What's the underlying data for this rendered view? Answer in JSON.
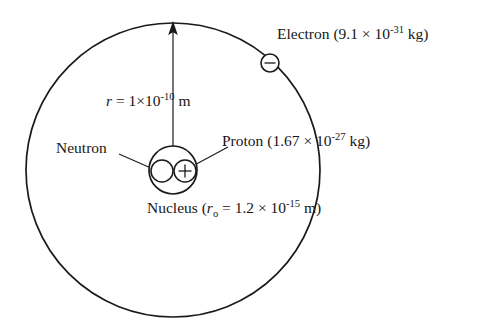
{
  "diagram": {
    "type": "atom-model",
    "stroke_color": "#1a1a1a",
    "background_color": "#ffffff",
    "orbit": {
      "center_x": 173,
      "center_y": 170,
      "radius": 147
    },
    "nucleus": {
      "center_x": 173,
      "center_y": 170,
      "radius": 24
    },
    "neutron_particle": {
      "center_x": 162,
      "center_y": 171,
      "radius": 11
    },
    "proton_particle": {
      "center_x": 185,
      "center_y": 171,
      "radius": 11,
      "charge_symbol": "+"
    },
    "electron_particle": {
      "center_x": 270,
      "center_y": 63,
      "radius": 9,
      "charge_symbol": "-"
    },
    "radius_arrow": {
      "from_x": 173,
      "from_y": 170,
      "to_x": 173,
      "to_y": 24
    }
  },
  "labels": {
    "electron": {
      "name": "Electron",
      "open_paren": "(",
      "mantissa": "9.1",
      "times": " × ",
      "base": "10",
      "exponent": "-31",
      "unit": " kg",
      "close_paren": ")"
    },
    "radius": {
      "symbol": "r",
      "equals": " = ",
      "mantissa": "1",
      "times": "×",
      "base": "10",
      "exponent": "-10",
      "unit": " m"
    },
    "proton": {
      "name": "Proton",
      "open_paren": "(",
      "mantissa": "1.67",
      "times": " × ",
      "base": "10",
      "exponent": "-27",
      "unit": " kg",
      "close_paren": ")"
    },
    "neutron": {
      "name": "Neutron"
    },
    "nucleus": {
      "name": "Nucleus",
      "open_paren": "(",
      "symbol": "r",
      "subscript": "o",
      "equals": " = ",
      "mantissa": "1.2",
      "times": " × ",
      "base": "10",
      "exponent": "-15",
      "unit": " m",
      "close_paren": ")"
    }
  }
}
